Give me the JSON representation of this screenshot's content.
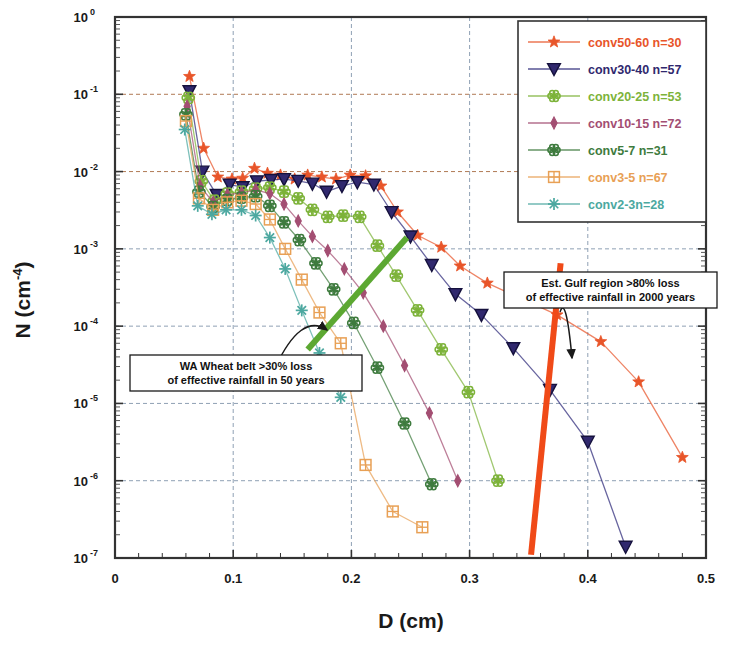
{
  "chart_data": {
    "type": "line",
    "title": "",
    "xlabel": "D  (cm)",
    "ylabel": "N (cm-4)",
    "ylabel_base": "N (cm",
    "ylabel_exp": "-4",
    "ylabel_close": ")",
    "xlim": [
      0,
      0.5
    ],
    "ylim": [
      1e-07,
      1
    ],
    "yscale": "log",
    "xscale": "linear",
    "grid": true,
    "legend_position": "top-right",
    "xticks": [
      "0",
      "0.1",
      "0.2",
      "0.3",
      "0.4",
      "0.5"
    ],
    "xtick_values": [
      0,
      0.1,
      0.2,
      0.3,
      0.4,
      0.5
    ],
    "yticks": [
      "10^0",
      "10^-1",
      "10^-2",
      "10^-3",
      "10^-4",
      "10^-5",
      "10^-6",
      "10^-7"
    ],
    "ytick_mantissa": "10",
    "ytick_exponents": [
      "0",
      "-1",
      "-2",
      "-3",
      "-4",
      "-5",
      "-6",
      "-7"
    ],
    "ytick_values": [
      1,
      0.1,
      0.01,
      0.001,
      0.0001,
      1e-05,
      1e-06,
      1e-07
    ],
    "series": [
      {
        "name": "conv50-60 n=30",
        "color": "#E8552A",
        "marker": "star",
        "x": [
          0.063,
          0.075,
          0.087,
          0.099,
          0.108,
          0.118,
          0.129,
          0.14,
          0.152,
          0.163,
          0.175,
          0.187,
          0.199,
          0.212,
          0.225,
          0.239,
          0.256,
          0.276,
          0.292,
          0.315,
          0.343,
          0.374,
          0.411,
          0.443,
          0.48
        ],
        "y": [
          0.17,
          0.02,
          0.0085,
          0.008,
          0.0082,
          0.011,
          0.0095,
          0.009,
          0.008,
          0.009,
          0.0085,
          0.008,
          0.009,
          0.0088,
          0.0065,
          0.003,
          0.0015,
          0.00105,
          0.0006,
          0.00036,
          0.00023,
          0.00014,
          6.3e-05,
          1.9e-05,
          2e-06
        ]
      },
      {
        "name": "conv30-40 n=57",
        "color": "#2E2A7A",
        "marker": "triangle-down",
        "x": [
          0.063,
          0.074,
          0.086,
          0.097,
          0.108,
          0.12,
          0.132,
          0.143,
          0.155,
          0.167,
          0.179,
          0.192,
          0.205,
          0.219,
          0.234,
          0.25,
          0.268,
          0.288,
          0.31,
          0.337,
          0.368,
          0.4,
          0.432
        ],
        "y": [
          0.11,
          0.01,
          0.005,
          0.0068,
          0.0063,
          0.0075,
          0.0078,
          0.008,
          0.0076,
          0.007,
          0.0055,
          0.0065,
          0.0073,
          0.0068,
          0.003,
          0.00145,
          0.00062,
          0.00026,
          0.00014,
          5.2e-05,
          1.5e-05,
          3.2e-06,
          1.4e-07
        ]
      },
      {
        "name": "conv20-25 n=53",
        "color": "#7DB33A",
        "marker": "flower",
        "x": [
          0.062,
          0.073,
          0.084,
          0.095,
          0.107,
          0.119,
          0.131,
          0.143,
          0.155,
          0.167,
          0.18,
          0.193,
          0.207,
          0.222,
          0.238,
          0.256,
          0.276,
          0.299,
          0.324
        ],
        "y": [
          0.09,
          0.0075,
          0.0042,
          0.0052,
          0.0055,
          0.006,
          0.0062,
          0.0055,
          0.0045,
          0.0032,
          0.0026,
          0.0027,
          0.0026,
          0.0011,
          0.00045,
          0.00016,
          5e-05,
          1.4e-05,
          1e-06
        ]
      },
      {
        "name": "conv10-15 n=72",
        "color": "#A34E72",
        "marker": "diamond",
        "x": [
          0.061,
          0.072,
          0.083,
          0.095,
          0.107,
          0.119,
          0.131,
          0.143,
          0.155,
          0.167,
          0.18,
          0.194,
          0.21,
          0.227,
          0.245,
          0.266,
          0.29
        ],
        "y": [
          0.07,
          0.0065,
          0.004,
          0.005,
          0.0053,
          0.0058,
          0.0052,
          0.0038,
          0.0023,
          0.00145,
          0.00095,
          0.00055,
          0.00027,
          0.0001,
          3.1e-05,
          7.5e-06,
          1e-06
        ]
      },
      {
        "name": "conv5-7 n=31",
        "color": "#3E7B3E",
        "marker": "flower",
        "x": [
          0.06,
          0.071,
          0.083,
          0.095,
          0.107,
          0.119,
          0.131,
          0.143,
          0.156,
          0.17,
          0.185,
          0.202,
          0.222,
          0.245,
          0.268
        ],
        "y": [
          0.055,
          0.0055,
          0.0035,
          0.0043,
          0.0046,
          0.0048,
          0.0036,
          0.0022,
          0.0013,
          0.00065,
          0.0003,
          0.00011,
          2.9e-05,
          5.5e-06,
          9e-07
        ]
      },
      {
        "name": "conv3-5 n=67",
        "color": "#E8A055",
        "marker": "square-cross",
        "x": [
          0.06,
          0.071,
          0.083,
          0.095,
          0.107,
          0.119,
          0.131,
          0.144,
          0.158,
          0.173,
          0.191,
          0.212,
          0.235,
          0.26
        ],
        "y": [
          0.045,
          0.0045,
          0.0032,
          0.004,
          0.0042,
          0.0038,
          0.0024,
          0.001,
          0.0004,
          0.00015,
          6e-05,
          1.6e-06,
          4e-07,
          2.5e-07
        ]
      },
      {
        "name": "conv2-3n=28",
        "color": "#4CA8A0",
        "marker": "asterisk",
        "x": [
          0.059,
          0.07,
          0.082,
          0.094,
          0.107,
          0.119,
          0.131,
          0.144,
          0.158,
          0.173,
          0.191
        ],
        "y": [
          0.035,
          0.0036,
          0.0028,
          0.0032,
          0.0032,
          0.0027,
          0.0014,
          0.00055,
          0.00016,
          4.5e-05,
          1.2e-05
        ]
      }
    ],
    "trend_lines": [
      {
        "name": "wa-wheat-belt-trend",
        "color": "#5CA832",
        "x1": 0.163,
        "y1": 5e-05,
        "x2": 0.247,
        "y2": 0.0014
      },
      {
        "name": "gulf-region-trend",
        "color": "#F04A18",
        "x1": 0.352,
        "y1": 1.1e-07,
        "x2": 0.377,
        "y2": 0.00065
      }
    ],
    "annotations": [
      {
        "name": "wa-wheat-belt-annotation",
        "line1": "WA Wheat belt >30% loss",
        "line2": "of effective rainfall in 50 years",
        "box_x": 130,
        "box_y": 355,
        "box_w": 232,
        "box_h": 36,
        "arrow_from_x": 275,
        "arrow_from_y": 368,
        "arrow_to_x": 327,
        "arrow_to_y": 330
      },
      {
        "name": "gulf-region-annotation",
        "line1": "Est. Gulf region >80% loss",
        "line2": "of effective rainfall in 2000 years",
        "box_x": 504,
        "box_y": 272,
        "box_w": 213,
        "box_h": 36,
        "arrow_from_x": 560,
        "arrow_from_y": 312,
        "arrow_to_x": 572,
        "arrow_to_y": 358
      }
    ]
  },
  "figure": {
    "background": "#ffffff",
    "frame_color": "#333333",
    "grid_color": "#8899aa"
  }
}
